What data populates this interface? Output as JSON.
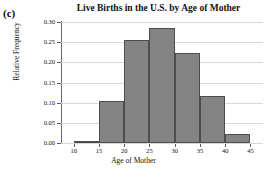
{
  "part_label": "(c)",
  "chart_data": {
    "type": "bar",
    "title": "Live Births in the U.S. by Age of Mother",
    "xlabel": "Age of Mother",
    "ylabel": "Relative Frequency",
    "grid": true,
    "legend": "none",
    "xlim": [
      7.5,
      47.5
    ],
    "ylim": [
      0.0,
      0.3
    ],
    "bin_width": 5,
    "x_ticks": [
      10,
      15,
      20,
      25,
      30,
      35,
      40,
      45
    ],
    "x_tick_labels": [
      "10",
      "15",
      "20",
      "25",
      "30",
      "35",
      "40",
      "45"
    ],
    "y_ticks": [
      0.0,
      0.05,
      0.1,
      0.15,
      0.2,
      0.25,
      0.3
    ],
    "y_tick_labels": [
      "0.00",
      "0.05",
      "0.10",
      "0.15",
      "0.20",
      "0.25",
      "0.30"
    ],
    "categories": [
      "10-15",
      "15-20",
      "20-25",
      "25-30",
      "30-35",
      "35-40",
      "40-45"
    ],
    "bin_edges": [
      10,
      15,
      20,
      25,
      30,
      35,
      40,
      45
    ],
    "values": [
      0.005,
      0.105,
      0.256,
      0.286,
      0.223,
      0.117,
      0.022
    ],
    "bar_fill_color": "#848484",
    "bar_edge_color": "#4d4d4d",
    "grid_color": "#d8d8d8",
    "axis_color": "#6a6a6a"
  }
}
